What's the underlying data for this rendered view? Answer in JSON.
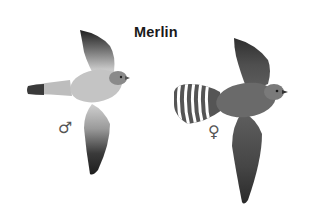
{
  "title": "Merlin",
  "figures": [
    {
      "id": "male",
      "label_symbol": "♂",
      "description": "Male Merlin in flight, underside view; pale grey body, dark wingtips, dark-banded tail tip",
      "colors": {
        "body": "#c4c4c4",
        "wing_light": "#d2d2d2",
        "wingtip": "#2e2e2e",
        "tail_band": "#3a3a3a",
        "head": "#8a8a8a"
      }
    },
    {
      "id": "female",
      "label_symbol": "♀",
      "description": "Female Merlin in flight, underside view; dark brown-grey body, heavily barred white-banded tail",
      "colors": {
        "body": "#6a6a6a",
        "wing": "#5a5a5a",
        "wingtip": "#333333",
        "tail_dark": "#555555",
        "tail_light": "#ffffff",
        "head": "#7a7a7a"
      }
    }
  ]
}
